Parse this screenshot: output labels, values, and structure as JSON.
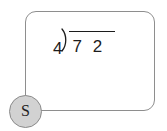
{
  "card": {
    "name": "problem-card"
  },
  "problem": {
    "divisor": "4",
    "bracket_icon": "division-bracket-icon",
    "dividend": "7 2",
    "expression_text": "4)72",
    "operation": "long-division"
  },
  "step_badge": {
    "label": "S",
    "shape": "circle",
    "fill_color": "#d2d2d2",
    "border_color": "#8a8a8a",
    "text_color": "#1f1f1f"
  },
  "style": {
    "background_color": "#ffffff",
    "card_border_color": "#8e8e8e",
    "ink_color": "#1c1c1c"
  }
}
